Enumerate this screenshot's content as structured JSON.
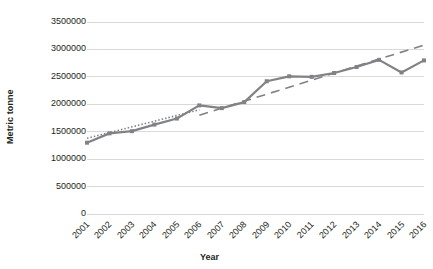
{
  "chart_data": {
    "type": "line",
    "title": "",
    "xlabel": "Year",
    "ylabel": "Metric tonne",
    "categories": [
      "2001",
      "2002",
      "2003",
      "2004",
      "2005",
      "2006",
      "2007",
      "2008",
      "2009",
      "2010",
      "2011",
      "2012",
      "2013",
      "2014",
      "2015",
      "2016"
    ],
    "series": [
      {
        "name": "Production",
        "style": "solid-line-with-square-markers",
        "color": "#808285",
        "values": [
          1300000,
          1470000,
          1510000,
          1630000,
          1740000,
          1980000,
          1930000,
          2040000,
          2420000,
          2510000,
          2500000,
          2570000,
          2680000,
          2810000,
          2580000,
          2800000
        ]
      },
      {
        "name": "Trend (2001-2006)",
        "style": "dotted-trendline",
        "color": "#808285",
        "x": [
          "2001",
          "2006"
        ],
        "values": [
          1380000,
          1900000
        ]
      },
      {
        "name": "Trend (2006-2016)",
        "style": "dashed-trendline",
        "color": "#808285",
        "x": [
          "2006",
          "2016"
        ],
        "values": [
          1800000,
          3080000
        ]
      }
    ],
    "ylim": [
      0,
      3500000
    ],
    "ytick_labels": [
      "0",
      "500000",
      "1000000",
      "1500000",
      "2000000",
      "2500000",
      "3000000",
      "3500000"
    ],
    "ytick_values": [
      0,
      500000,
      1000000,
      1500000,
      2000000,
      2500000,
      3000000,
      3500000
    ],
    "grid": "horizontal",
    "legend": "none",
    "background": "#ffffff",
    "gridline_color": "#d9d9d9"
  }
}
